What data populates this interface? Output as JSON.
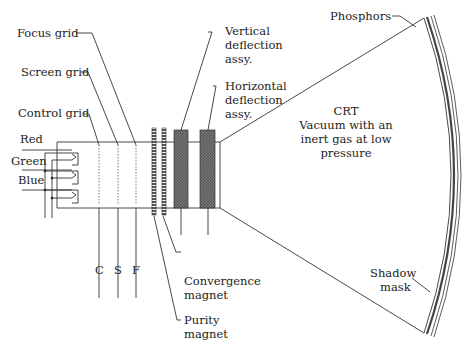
{
  "labels": {
    "focus_grid": "Focus grid",
    "screen_grid": "Screen grid",
    "control_grid": "Control grid",
    "red": "Red",
    "green": "Green",
    "blue": "Blue",
    "c": "C",
    "s": "S",
    "f": "F",
    "vertical_1": "Vertical",
    "vertical_2": "deflection",
    "vertical_3": "assy.",
    "horizontal_1": "Horizontal",
    "horizontal_2": "deflection",
    "horizontal_3": "assy.",
    "crt_1": "CRT",
    "crt_2": "Vacuum with an",
    "crt_3": "inert gas at low",
    "crt_4": "pressure",
    "phosphors": "Phosphors",
    "shadow_1": "Shadow",
    "shadow_2": "mask",
    "convergence_1": "Convergence",
    "convergence_2": "magnet",
    "purity_1": "Purity",
    "purity_2": "magnet"
  },
  "colors": {
    "line": "#333333",
    "coil_fill": "#666666",
    "magnet_fill": "#888888"
  }
}
